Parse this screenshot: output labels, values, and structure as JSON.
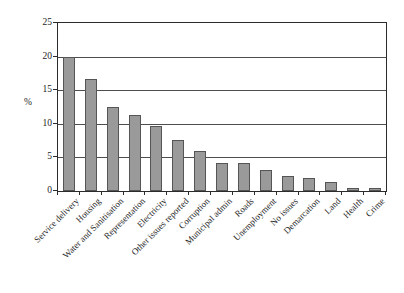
{
  "chart_data": {
    "type": "bar",
    "title": "",
    "xlabel": "",
    "ylabel": "%",
    "ylim": [
      0,
      25
    ],
    "yticks": [
      "0",
      "5",
      "10",
      "15",
      "20",
      "25"
    ],
    "grid": true,
    "legend": "none",
    "orientation": "vertical",
    "bar_color": "#9a9a9a",
    "bar_edge_color": "#555555",
    "axis_color": "#2b2b2b",
    "categories": [
      "Service delivery",
      "Housing",
      "Water and Sanitisation",
      "Representation",
      "Electricity",
      "Other issues reported",
      "Corruption",
      "Municipal admin",
      "Roads",
      "Unemployment",
      "No issues",
      "Demarcation",
      "Land",
      "Health",
      "Crime"
    ],
    "values": [
      19.9,
      16.6,
      12.5,
      11.3,
      9.7,
      7.6,
      6.0,
      4.2,
      4.1,
      3.2,
      2.3,
      2.0,
      1.4,
      0.5,
      0.45
    ]
  }
}
